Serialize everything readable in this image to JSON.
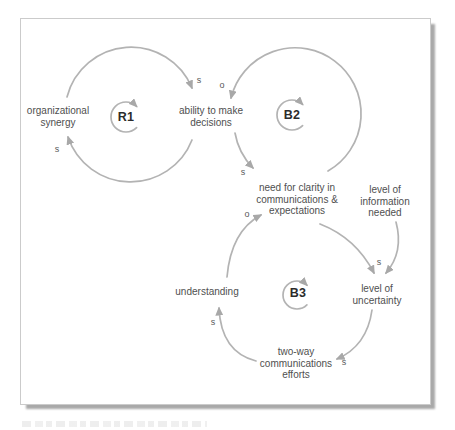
{
  "colors": {
    "arc": "#b3b3b3",
    "arrowhead": "#a8a8a8",
    "node_text": "#4f4f4f",
    "loop_label_text": "#2b2b2b",
    "polarity_text": "#5a5a5a",
    "frame_border": "#cbcbcb",
    "frame_shadow": "#a9a9a9",
    "background": "#ffffff"
  },
  "loops": [
    {
      "label": "R1"
    },
    {
      "label": "B2"
    },
    {
      "label": "B3"
    }
  ],
  "nodes": [
    {
      "label": "organizational\nsynergy"
    },
    {
      "label": "ability to make\ndecisions"
    },
    {
      "label": "need for clarity in\ncommunications &\nexpectations"
    },
    {
      "label": "level of\ninformation\nneeded"
    },
    {
      "label": "understanding"
    },
    {
      "label": "level of\nuncertainty"
    },
    {
      "label": "two-way\ncommunications\nefforts"
    }
  ],
  "links": [
    {
      "from": "organizational synergy",
      "to": "ability to make decisions",
      "polarity": "s",
      "loop": "R1"
    },
    {
      "from": "ability to make decisions",
      "to": "organizational synergy",
      "polarity": "s",
      "loop": "R1"
    },
    {
      "from": "need for clarity in communications & expectations",
      "to": "ability to make decisions",
      "polarity": "o",
      "loop": "B2"
    },
    {
      "from": "ability to make decisions",
      "to": "need for clarity in communications & expectations",
      "polarity": "s",
      "loop": "B2"
    },
    {
      "from": "need for clarity in communications & expectations",
      "to": "level of uncertainty",
      "polarity": "s",
      "loop": "B3"
    },
    {
      "from": "level of information needed",
      "to": "level of uncertainty",
      "polarity": "",
      "loop": ""
    },
    {
      "from": "level of uncertainty",
      "to": "two-way communications efforts",
      "polarity": "s",
      "loop": "B3"
    },
    {
      "from": "two-way communications efforts",
      "to": "understanding",
      "polarity": "s",
      "loop": "B3"
    },
    {
      "from": "understanding",
      "to": "need for clarity in communications & expectations",
      "polarity": "o",
      "loop": "B3"
    }
  ]
}
